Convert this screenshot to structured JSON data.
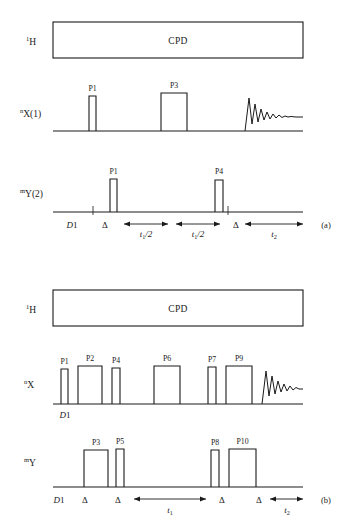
{
  "figure": {
    "background_color": "#ffffff",
    "line_color": "#1a1a1a",
    "panels": [
      {
        "tag": "(a)",
        "channels": [
          {
            "id": "proton",
            "superscript": "1",
            "name": "H",
            "block_label": "CPD",
            "block_type": "decoupling-box"
          },
          {
            "id": "x-channel",
            "superscript": "n",
            "name": "X(1)",
            "pulses": [
              {
                "label": "P1",
                "width": "narrow"
              },
              {
                "label": "P3",
                "width": "wide"
              }
            ],
            "acquisition": "fid"
          },
          {
            "id": "y-channel",
            "superscript": "m",
            "name": "Y(2)",
            "pulses": [
              {
                "label": "P1",
                "width": "narrow"
              },
              {
                "label": "P4",
                "width": "narrow"
              }
            ]
          }
        ],
        "timing": [
          {
            "label": "D1",
            "style": "italic-d",
            "kind": "interval-text"
          },
          {
            "label": "Δ",
            "kind": "delta"
          },
          {
            "label": "t1/2",
            "base": "t",
            "subscript": "1",
            "suffix": "/2",
            "kind": "arrow-span"
          },
          {
            "label": "t1/2",
            "base": "t",
            "subscript": "1",
            "suffix": "/2",
            "kind": "arrow-span"
          },
          {
            "label": "Δ",
            "kind": "delta"
          },
          {
            "label": "t2",
            "base": "t",
            "subscript": "2",
            "suffix": "",
            "kind": "arrow-span"
          }
        ]
      },
      {
        "tag": "(b)",
        "channels": [
          {
            "id": "proton",
            "superscript": "1",
            "name": "H",
            "block_label": "CPD",
            "block_type": "decoupling-box"
          },
          {
            "id": "x-channel",
            "superscript": "n",
            "name": "X",
            "pulses": [
              {
                "label": "P1",
                "width": "narrow"
              },
              {
                "label": "P2",
                "width": "wide"
              },
              {
                "label": "P4",
                "width": "narrow"
              },
              {
                "label": "P6",
                "width": "wide"
              },
              {
                "label": "P7",
                "width": "narrow"
              },
              {
                "label": "P9",
                "width": "wide"
              }
            ],
            "acquisition": "fid",
            "baseline_label": "D1"
          },
          {
            "id": "y-channel",
            "superscript": "m",
            "name": "Y",
            "pulses": [
              {
                "label": "P3",
                "width": "wide"
              },
              {
                "label": "P5",
                "width": "narrow"
              },
              {
                "label": "P8",
                "width": "narrow"
              },
              {
                "label": "P10",
                "width": "wide"
              }
            ]
          }
        ],
        "timing": [
          {
            "label": "D1",
            "style": "italic-d",
            "kind": "interval-text"
          },
          {
            "label": "Δ",
            "kind": "delta"
          },
          {
            "label": "Δ",
            "kind": "delta"
          },
          {
            "label": "t1",
            "base": "t",
            "subscript": "1",
            "suffix": "",
            "kind": "arrow-span"
          },
          {
            "label": "Δ",
            "kind": "delta"
          },
          {
            "label": "Δ",
            "kind": "delta"
          },
          {
            "label": "t2",
            "base": "t",
            "subscript": "2",
            "suffix": "",
            "kind": "arrow-span"
          }
        ]
      }
    ]
  }
}
